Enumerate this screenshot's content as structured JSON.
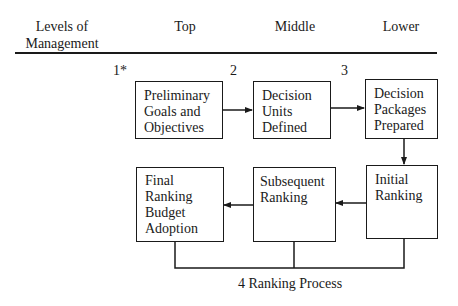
{
  "header": {
    "columns": [
      {
        "label_line1": "Levels of",
        "label_line2": "Management"
      },
      {
        "label": "Top"
      },
      {
        "label": "Middle"
      },
      {
        "label": "Lower"
      }
    ]
  },
  "steps": {
    "step1_marker": "1*",
    "step2_marker": "2",
    "step3_marker": "3",
    "step4_caption": "4 Ranking Process"
  },
  "boxes": {
    "preliminary_goals": {
      "lines": [
        "Preliminary",
        "Goals and",
        "Objectives"
      ]
    },
    "decision_units": {
      "lines": [
        "Decision",
        "Units",
        "Defined"
      ]
    },
    "decision_packages": {
      "lines": [
        "Decision",
        "Packages",
        "Prepared"
      ]
    },
    "initial_ranking": {
      "lines": [
        "Initial",
        "Ranking"
      ]
    },
    "subsequent_ranking": {
      "lines": [
        "Subsequent",
        "Ranking"
      ]
    },
    "final_ranking": {
      "lines": [
        "Final",
        "Ranking",
        "Budget",
        "Adoption"
      ]
    }
  },
  "colors": {
    "line": "#1a1a1a",
    "background": "#ffffff"
  }
}
